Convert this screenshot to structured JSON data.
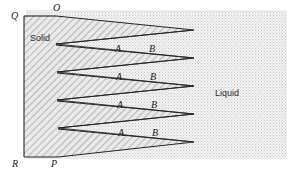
{
  "figure": {
    "width": 304,
    "height": 179,
    "background_color": "#ffffff"
  },
  "regions": {
    "solid": {
      "label": "Solid",
      "label_x": 30,
      "label_y": 34,
      "fill_color": "#e8e8e8",
      "hatch_color": "#6e6e6e",
      "hatch_angle_deg": 45
    },
    "liquid": {
      "label": "Liquid",
      "label_x": 215,
      "label_y": 89,
      "fill_color": "#efefef",
      "stipple_color": "#c9c9c9",
      "left_edge_x": 24,
      "right_edge_x": 288,
      "top_edge_y": 8,
      "bottom_edge_y": 160
    }
  },
  "line_color": "#262626",
  "vertices": [
    {
      "name": "Q",
      "label": "Q",
      "x": 24,
      "y": 16,
      "label_x": 11,
      "label_y": 11
    },
    {
      "name": "O",
      "label": "O",
      "x": 56,
      "y": 16,
      "label_x": 53,
      "label_y": 3
    },
    {
      "name": "R",
      "label": "R",
      "x": 24,
      "y": 157,
      "label_x": 12,
      "label_y": 159
    },
    {
      "name": "P",
      "label": "P",
      "x": 58,
      "y": 157,
      "label_x": 51,
      "label_y": 159
    }
  ],
  "spikes": [
    {
      "index": 1,
      "base_top_x": 56,
      "base_top_y": 16,
      "base_bottom_x": 56,
      "base_bottom_y": 44,
      "tip_x": 194,
      "tip_y": 30
    },
    {
      "index": 2,
      "base_top_x": 56,
      "base_top_y": 45,
      "base_bottom_x": 57,
      "base_bottom_y": 72,
      "tip_x": 194,
      "tip_y": 58
    },
    {
      "index": 3,
      "base_top_x": 57,
      "base_top_y": 73,
      "base_bottom_x": 57,
      "base_bottom_y": 100,
      "tip_x": 194,
      "tip_y": 86
    },
    {
      "index": 4,
      "base_top_x": 57,
      "base_top_y": 101,
      "base_bottom_x": 58,
      "base_bottom_y": 128,
      "tip_x": 194,
      "tip_y": 114
    },
    {
      "index": 5,
      "base_top_x": 58,
      "base_top_y": 129,
      "base_bottom_x": 58,
      "base_bottom_y": 157,
      "tip_x": 194,
      "tip_y": 142
    }
  ],
  "notches": [
    {
      "index": 1,
      "apex_x": 56,
      "apex_y": 44,
      "open_top_y": 30,
      "open_bottom_y": 58,
      "open_x": 194
    },
    {
      "index": 2,
      "apex_x": 57,
      "apex_y": 72,
      "open_top_y": 58,
      "open_bottom_y": 86,
      "open_x": 194
    },
    {
      "index": 3,
      "apex_x": 57,
      "apex_y": 100,
      "open_top_y": 86,
      "open_bottom_y": 114,
      "open_x": 194
    },
    {
      "index": 4,
      "apex_x": 58,
      "apex_y": 128,
      "open_top_y": 114,
      "open_bottom_y": 142,
      "open_x": 194
    }
  ],
  "point_labels": [
    {
      "name": "A",
      "text": "A",
      "x": 115,
      "y": 44
    },
    {
      "name": "B",
      "text": "B",
      "x": 149,
      "y": 44
    },
    {
      "name": "A",
      "text": "A",
      "x": 116,
      "y": 72
    },
    {
      "name": "B",
      "text": "B",
      "x": 150,
      "y": 72
    },
    {
      "name": "A",
      "text": "A",
      "x": 117,
      "y": 100
    },
    {
      "name": "B",
      "text": "B",
      "x": 151,
      "y": 100
    },
    {
      "name": "A",
      "text": "A",
      "x": 118,
      "y": 128
    },
    {
      "name": "B",
      "text": "B",
      "x": 152,
      "y": 128
    }
  ]
}
